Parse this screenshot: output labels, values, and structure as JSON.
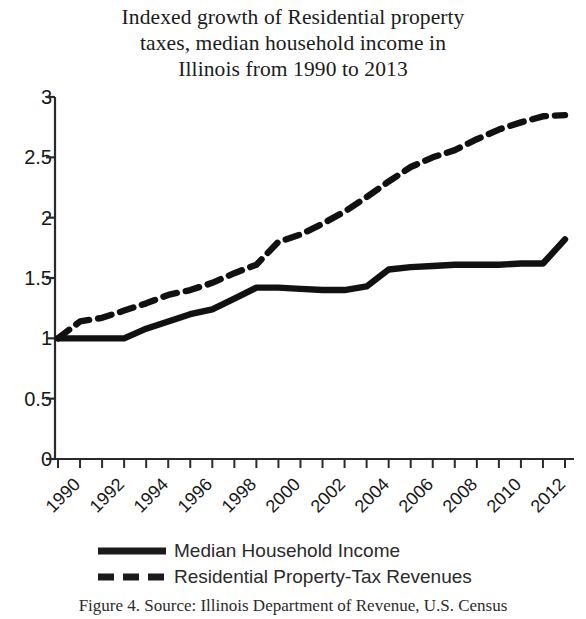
{
  "chart_data": {
    "type": "line",
    "title": "Indexed growth of Residential property taxes, median household income in Illinois from 1990 to 2013",
    "title_lines": [
      "Indexed growth of Residential property",
      "taxes, median household income in",
      "Illinois from 1990 to 2013"
    ],
    "xlabel": "",
    "ylabel": "",
    "ylim": [
      0,
      3
    ],
    "xlim": [
      1990,
      2013
    ],
    "ytick_labels": [
      "0",
      "0.5",
      "1",
      "1.5",
      "2",
      "2.5",
      "3"
    ],
    "ytick_values": [
      0,
      0.5,
      1,
      1.5,
      2,
      2.5,
      3
    ],
    "xtick_labels": [
      "1990",
      "1992",
      "1994",
      "1996",
      "1998",
      "2000",
      "2002",
      "2004",
      "2006",
      "2008",
      "2010",
      "2012"
    ],
    "xtick_values": [
      1990,
      1992,
      1994,
      1996,
      1998,
      2000,
      2002,
      2004,
      2006,
      2008,
      2010,
      2012
    ],
    "x": [
      1990,
      1991,
      1992,
      1993,
      1994,
      1995,
      1996,
      1997,
      1998,
      1999,
      2000,
      2001,
      2002,
      2003,
      2004,
      2005,
      2006,
      2007,
      2008,
      2009,
      2010,
      2011,
      2012,
      2013
    ],
    "grid": false,
    "legend_position": "bottom",
    "series": [
      {
        "name": "Median Household Income",
        "style": "solid",
        "color": "#111111",
        "values": [
          1.0,
          1.0,
          1.0,
          1.0,
          1.08,
          1.14,
          1.2,
          1.24,
          1.33,
          1.42,
          1.42,
          1.41,
          1.4,
          1.4,
          1.43,
          1.57,
          1.59,
          1.6,
          1.61,
          1.61,
          1.61,
          1.62,
          1.62,
          1.82
        ]
      },
      {
        "name": "Residential Property-Tax Revenues",
        "style": "dashed",
        "color": "#111111",
        "values": [
          1.0,
          1.14,
          1.17,
          1.23,
          1.29,
          1.36,
          1.4,
          1.46,
          1.54,
          1.61,
          1.8,
          1.86,
          1.95,
          2.05,
          2.17,
          2.3,
          2.42,
          2.5,
          2.56,
          2.65,
          2.73,
          2.79,
          2.84,
          2.85
        ]
      }
    ]
  },
  "legend": {
    "items": [
      {
        "label": "Median Household Income",
        "style": "solid"
      },
      {
        "label": "Residential Property-Tax Revenues",
        "style": "dashed"
      }
    ]
  },
  "caption": {
    "text": "Figure 4. Source: Illinois Department of Revenue, U.S. Census"
  }
}
